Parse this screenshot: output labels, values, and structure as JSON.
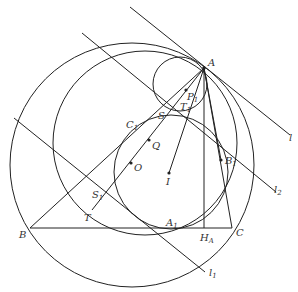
{
  "diagram": {
    "stroke_color": "#222222",
    "background": "#ffffff",
    "points": {
      "A": {
        "label": "A",
        "x": 204,
        "y": 68
      },
      "B": {
        "label": "B",
        "x": 30,
        "y": 228
      },
      "C": {
        "label": "C",
        "x": 232,
        "y": 228
      },
      "A1": {
        "label": "A",
        "sub": "1",
        "x": 172,
        "y": 228
      },
      "B1": {
        "label": "B",
        "sub": "1",
        "x": 221,
        "y": 160
      },
      "C1": {
        "label": "C",
        "sub": "1",
        "x": 139,
        "y": 124
      },
      "HA": {
        "label": "H",
        "sub": "A",
        "x": 204,
        "y": 228
      },
      "O": {
        "label": "O",
        "x": 131,
        "y": 163
      },
      "Q": {
        "label": "Q",
        "x": 149,
        "y": 140
      },
      "I": {
        "label": "I",
        "x": 169,
        "y": 173
      },
      "P1": {
        "label": "P",
        "sub": "1",
        "x": 186,
        "y": 90
      },
      "T1": {
        "label": "T",
        "sub": "1",
        "x": 190,
        "y": 103
      },
      "S": {
        "label": "S",
        "x": 166,
        "y": 118
      },
      "S1": {
        "label": "S",
        "sub": "1",
        "x": 100,
        "y": 196
      },
      "T": {
        "label": "T",
        "x": 92,
        "y": 211
      }
    },
    "lines": {
      "l": {
        "label": "l"
      },
      "l1": {
        "label": "l",
        "sub": "1"
      },
      "l2": {
        "label": "l",
        "sub": "2"
      }
    }
  }
}
